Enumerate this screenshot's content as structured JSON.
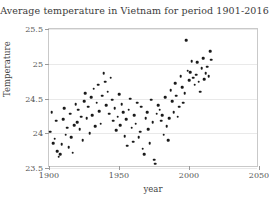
{
  "chart_data": {
    "type": "scatter",
    "title": "Average temperature in Vietnam for period 1901-2016",
    "xlabel": "year",
    "ylabel": "Temperature",
    "xlim": [
      1900,
      2050
    ],
    "ylim": [
      23.5,
      25.5
    ],
    "xticks": [
      1900,
      1950,
      2000,
      2050
    ],
    "xticklabels": [
      "1900",
      "1950",
      "2000",
      "2050"
    ],
    "yticks": [
      23.5,
      24,
      24.5,
      25,
      25.5
    ],
    "yticklabels": [
      "23.5",
      "24",
      "24.5",
      "25",
      "25.5"
    ],
    "grid": true,
    "legend": null,
    "marker_color": "#1a1a1a",
    "gridline_color": "#e9e9e9",
    "axis_color": "#c9c9c9",
    "x": [
      1901,
      1902,
      1903,
      1904,
      1905,
      1906,
      1907,
      1908,
      1909,
      1910,
      1911,
      1912,
      1913,
      1914,
      1915,
      1916,
      1917,
      1918,
      1919,
      1920,
      1921,
      1922,
      1923,
      1924,
      1925,
      1926,
      1927,
      1928,
      1929,
      1930,
      1931,
      1932,
      1933,
      1934,
      1935,
      1936,
      1937,
      1938,
      1939,
      1940,
      1941,
      1942,
      1943,
      1944,
      1945,
      1946,
      1947,
      1948,
      1949,
      1950,
      1951,
      1952,
      1953,
      1954,
      1955,
      1956,
      1957,
      1958,
      1959,
      1960,
      1961,
      1962,
      1963,
      1964,
      1965,
      1966,
      1967,
      1968,
      1969,
      1970,
      1971,
      1972,
      1973,
      1974,
      1975,
      1976,
      1977,
      1978,
      1979,
      1980,
      1981,
      1982,
      1983,
      1984,
      1985,
      1986,
      1987,
      1988,
      1989,
      1990,
      1991,
      1992,
      1993,
      1994,
      1995,
      1996,
      1997,
      1998,
      1999,
      2000,
      2001,
      2002,
      2003,
      2004,
      2005,
      2006,
      2007,
      2008,
      2009,
      2010,
      2011,
      2012,
      2013,
      2014,
      2015,
      2016
    ],
    "y": [
      24.02,
      24.3,
      23.86,
      23.92,
      24.18,
      23.74,
      23.66,
      23.7,
      23.84,
      24.2,
      24.36,
      23.98,
      24.08,
      23.8,
      24.28,
      23.94,
      23.72,
      24.12,
      24.42,
      24.16,
      24.34,
      24.06,
      24.24,
      23.9,
      24.46,
      24.58,
      24.22,
      24.38,
      24.0,
      24.52,
      24.26,
      24.64,
      24.1,
      24.44,
      24.7,
      24.32,
      24.14,
      24.54,
      24.86,
      24.74,
      24.4,
      24.6,
      24.28,
      24.8,
      24.48,
      24.18,
      24.36,
      24.04,
      24.24,
      24.56,
      24.12,
      24.42,
      24.3,
      23.96,
      24.2,
      23.82,
      24.34,
      24.5,
      24.08,
      23.88,
      24.26,
      24.14,
      24.44,
      23.94,
      24.02,
      24.38,
      23.78,
      23.7,
      24.22,
      24.3,
      24.06,
      23.86,
      24.48,
      24.16,
      23.62,
      23.56,
      24.28,
      24.4,
      24.34,
      24.18,
      24.26,
      23.98,
      24.52,
      24.1,
      23.9,
      24.22,
      24.62,
      24.46,
      24.3,
      24.72,
      24.54,
      24.24,
      24.38,
      24.82,
      24.66,
      24.44,
      24.58,
      25.34,
      24.9,
      24.76,
      24.88,
      25.04,
      24.8,
      24.7,
      24.84,
      25.02,
      24.74,
      24.6,
      24.94,
      25.08,
      24.78,
      24.86,
      24.96,
      24.82,
      25.18,
      25.06
    ]
  }
}
